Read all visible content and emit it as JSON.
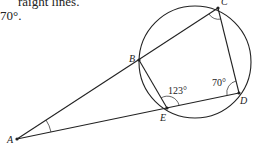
{
  "caption": {
    "line1": "raight lines.",
    "line2": "70°."
  },
  "diagram": {
    "type": "circle geometry",
    "points": [
      {
        "label": "A",
        "x": 17,
        "y": 139
      },
      {
        "label": "B",
        "x": 139,
        "y": 60
      },
      {
        "label": "C",
        "x": 218,
        "y": 8
      },
      {
        "label": "D",
        "x": 239,
        "y": 93
      },
      {
        "label": "E",
        "x": 167,
        "y": 108
      }
    ],
    "circle": {
      "cx": 195,
      "cy": 62,
      "r": 56
    },
    "segments": [
      "A-C",
      "A-D",
      "B-E",
      "C-D"
    ],
    "angles": [
      {
        "at": "E",
        "label": "123°"
      },
      {
        "at": "D",
        "label": "70°"
      },
      {
        "at": "C",
        "label": ""
      },
      {
        "at": "A",
        "label": ""
      }
    ],
    "colors": {
      "stroke": "#222222",
      "background": "#ffffff"
    }
  }
}
